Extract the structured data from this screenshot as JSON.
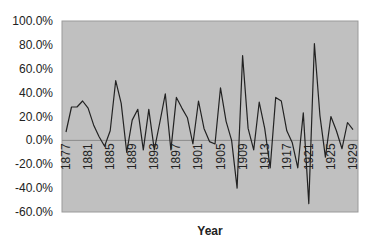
{
  "chart_data": {
    "type": "line",
    "title": "",
    "xlabel": "Year",
    "ylabel": "",
    "ylim": [
      -60,
      100
    ],
    "yticks": [
      "100.0%",
      "80.0%",
      "60.0%",
      "40.0%",
      "20.0%",
      "0.0%",
      "-20.0%",
      "-40.0%",
      "-60.0%"
    ],
    "xticks": [
      "1877",
      "1881",
      "1885",
      "1889",
      "1893",
      "1897",
      "1901",
      "1905",
      "1909",
      "1913",
      "1917",
      "1921",
      "1925",
      "1929"
    ],
    "grid": false,
    "legend": null,
    "plot_background": "#c0c0c0",
    "line_color": "#222222",
    "x": [
      1877,
      1878,
      1879,
      1880,
      1881,
      1882,
      1883,
      1884,
      1885,
      1886,
      1887,
      1888,
      1889,
      1890,
      1891,
      1892,
      1893,
      1894,
      1895,
      1896,
      1897,
      1898,
      1899,
      1900,
      1901,
      1902,
      1903,
      1904,
      1905,
      1906,
      1907,
      1908,
      1909,
      1910,
      1911,
      1912,
      1913,
      1914,
      1915,
      1916,
      1917,
      1918,
      1919,
      1920,
      1921,
      1922,
      1923,
      1924,
      1925,
      1926,
      1927,
      1928,
      1929
    ],
    "series": [
      {
        "name": "Annual return",
        "values": [
          7,
          28,
          28,
          33,
          27,
          13,
          3,
          -5,
          8,
          50,
          31,
          -10,
          17,
          26,
          -8,
          26,
          -8,
          15,
          39,
          -8,
          36,
          27,
          19,
          -3,
          33,
          10,
          -1,
          -3,
          44,
          16,
          0,
          -40,
          71,
          10,
          -8,
          32,
          10,
          -23,
          36,
          33,
          8,
          -2,
          -23,
          23,
          -53,
          81,
          21,
          -14,
          20,
          8,
          -7,
          15,
          9
        ]
      }
    ]
  }
}
